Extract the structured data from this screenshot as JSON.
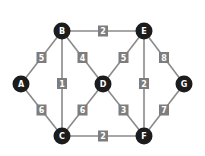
{
  "graph": {
    "nodes": [
      {
        "id": "A",
        "x": 21,
        "y": 84
      },
      {
        "id": "B",
        "x": 62,
        "y": 31
      },
      {
        "id": "C",
        "x": 62,
        "y": 136
      },
      {
        "id": "D",
        "x": 103,
        "y": 84
      },
      {
        "id": "E",
        "x": 144,
        "y": 31
      },
      {
        "id": "F",
        "x": 144,
        "y": 136
      },
      {
        "id": "G",
        "x": 184,
        "y": 84
      }
    ],
    "edges": [
      {
        "from": "A",
        "to": "B",
        "weight": "5"
      },
      {
        "from": "A",
        "to": "C",
        "weight": "6"
      },
      {
        "from": "B",
        "to": "C",
        "weight": "1"
      },
      {
        "from": "B",
        "to": "D",
        "weight": "4"
      },
      {
        "from": "B",
        "to": "E",
        "weight": "2"
      },
      {
        "from": "C",
        "to": "D",
        "weight": "6"
      },
      {
        "from": "C",
        "to": "F",
        "weight": "2"
      },
      {
        "from": "D",
        "to": "E",
        "weight": "5"
      },
      {
        "from": "D",
        "to": "F",
        "weight": "3"
      },
      {
        "from": "E",
        "to": "F",
        "weight": "2"
      },
      {
        "from": "E",
        "to": "G",
        "weight": "8"
      },
      {
        "from": "F",
        "to": "G",
        "weight": "7"
      }
    ]
  },
  "colors": {
    "node": "#1c1c1c",
    "edge": "#8a8a8a",
    "weight_box": "#7d7d7d",
    "label": "#ffffff"
  }
}
